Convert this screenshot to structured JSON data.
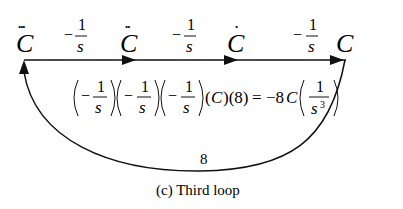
{
  "nodes": [
    {
      "id": "C3",
      "label": "C",
      "dots": "•••"
    },
    {
      "id": "C2",
      "label": "C",
      "dots": "••"
    },
    {
      "id": "C1",
      "label": "C",
      "dots": "•"
    },
    {
      "id": "C0",
      "label": "C",
      "dots": ""
    }
  ],
  "branches": [
    {
      "from": "C3",
      "to": "C2",
      "sign": "−",
      "num": "1",
      "den": "s"
    },
    {
      "from": "C2",
      "to": "C1",
      "sign": "−",
      "num": "1",
      "den": "s"
    },
    {
      "from": "C1",
      "to": "C0",
      "sign": "−",
      "num": "1",
      "den": "s"
    }
  ],
  "feedback": {
    "from": "C0",
    "to": "C3",
    "gain": "8"
  },
  "equation": {
    "factors": [
      {
        "sign": "−",
        "num": "1",
        "den": "s"
      },
      {
        "sign": "−",
        "num": "1",
        "den": "s"
      },
      {
        "sign": "−",
        "num": "1",
        "den": "s"
      }
    ],
    "tail": "(C)(8) = −8C",
    "tail_paren_c": "(C)",
    "tail_paren_8": "(8)",
    "equals": "=",
    "rhs_coef": "−8",
    "rhs_var": "C",
    "rhs_num": "1",
    "rhs_den": "s",
    "rhs_exp": "3"
  },
  "caption": "(c) Third loop"
}
